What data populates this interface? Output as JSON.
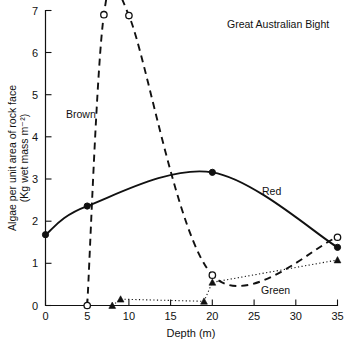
{
  "chart_data": {
    "type": "line",
    "title": "Great Australian Bight",
    "xlabel": "Depth (m)",
    "ylabel": "Algae per unit area of rock face (Kg wet mass m⁻²)",
    "ylabel_line1": "Algae per unit area of rock face",
    "ylabel_line2": "(Kg wet mass m⁻²)",
    "xlim": [
      0,
      35
    ],
    "ylim": [
      0,
      7
    ],
    "xticks": [
      0,
      5,
      10,
      15,
      20,
      25,
      30,
      35
    ],
    "xtick_labels": [
      "0",
      "5",
      "10",
      "15",
      "20",
      "25",
      "30",
      "35"
    ],
    "yticks": [
      0,
      1,
      2,
      3,
      4,
      5,
      6,
      7
    ],
    "ytick_labels": [
      "0",
      "1",
      "2",
      "3",
      "4",
      "5",
      "6",
      "7"
    ],
    "grid": false,
    "legend_position": "inline-annotations",
    "series": [
      {
        "name": "Brown",
        "label": "Brown",
        "line_style": "dashed",
        "marker": "open-circle",
        "color": "#111111",
        "x": [
          5,
          7,
          10,
          20,
          35
        ],
        "y": [
          0,
          6.9,
          6.88,
          0.72,
          1.62
        ]
      },
      {
        "name": "Red",
        "label": "Red",
        "line_style": "solid",
        "marker": "filled-circle",
        "color": "#111111",
        "x": [
          0,
          5,
          20,
          35
        ],
        "y": [
          1.68,
          2.36,
          3.16,
          1.38
        ]
      },
      {
        "name": "Green",
        "label": "Green",
        "line_style": "dotted",
        "marker": "triangle",
        "color": "#111111",
        "x": [
          8,
          9,
          19,
          20,
          35
        ],
        "y": [
          0,
          0.15,
          0.1,
          0.55,
          1.08
        ]
      }
    ],
    "annotations": [
      {
        "text": "Brown",
        "x_px": 66,
        "y_px": 114
      },
      {
        "text": "Red",
        "x_px": 262,
        "y_px": 191
      },
      {
        "text": "Green",
        "x_px": 261,
        "y_px": 290
      },
      {
        "text": "Great Australian Bight",
        "x_px": 227,
        "y_px": 28
      }
    ]
  }
}
